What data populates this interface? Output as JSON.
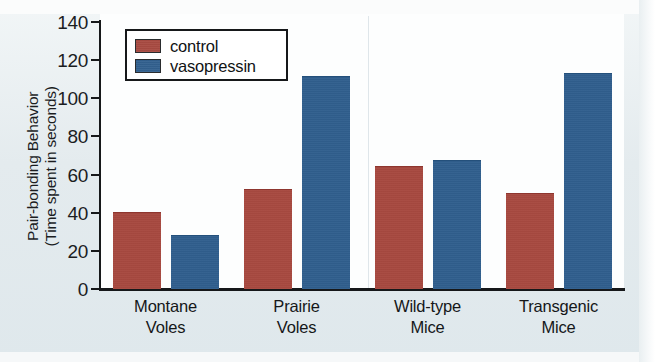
{
  "chart_data": {
    "type": "bar",
    "title": "",
    "xlabel": "",
    "ylabel": "Pair-bonding Behavior (Time spent in seconds)",
    "ylabel_lines": [
      "Pair-bonding Behavior",
      "(Time spent in seconds)"
    ],
    "categories": [
      "Montane Voles",
      "Prairie Voles",
      "Wild-type Mice",
      "Transgenic Mice"
    ],
    "category_lines": [
      [
        "Montane",
        "Voles"
      ],
      [
        "Prairie",
        "Voles"
      ],
      [
        "Wild-type",
        "Mice"
      ],
      [
        "Transgenic",
        "Mice"
      ]
    ],
    "series": [
      {
        "name": "control",
        "color": "#a9483f",
        "values": [
          40,
          52,
          64,
          50
        ]
      },
      {
        "name": "vasopressin",
        "color": "#2e5e8e",
        "values": [
          28,
          111,
          67,
          113
        ]
      }
    ],
    "ylim": [
      0,
      140
    ],
    "yticks": [
      0,
      20,
      40,
      60,
      80,
      100,
      120,
      140
    ],
    "ytick_labels": [
      "0",
      "20",
      "40",
      "60",
      "80",
      "100",
      "120",
      "140"
    ],
    "grid": false,
    "legend_position": "top-left",
    "legend_entries": [
      "control",
      "vasopressin"
    ]
  },
  "colors": {
    "control": "#a9483f",
    "vasopressin": "#2e5e8e",
    "axis": "#16181a",
    "plot_background": "#ffffff",
    "figure_background": "#e6edf0"
  }
}
